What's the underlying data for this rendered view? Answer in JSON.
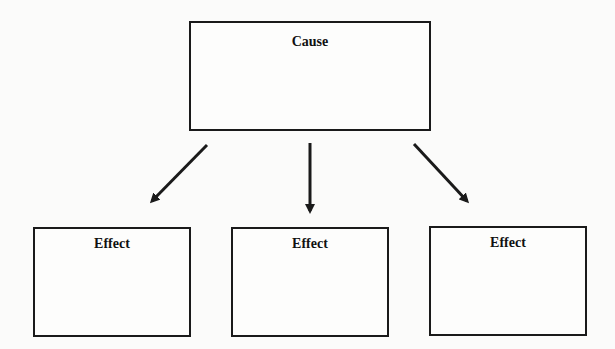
{
  "diagram": {
    "type": "cause-and-effect",
    "cause": {
      "label": "Cause"
    },
    "effects": [
      {
        "label": "Effect"
      },
      {
        "label": "Effect"
      },
      {
        "label": "Effect"
      }
    ],
    "arrows": [
      {
        "from": "cause",
        "to": "effect-1",
        "direction": "down-left"
      },
      {
        "from": "cause",
        "to": "effect-2",
        "direction": "down"
      },
      {
        "from": "cause",
        "to": "effect-3",
        "direction": "down-right"
      }
    ],
    "colors": {
      "stroke": "#1a1a1a",
      "background": "#fbfbfa"
    }
  }
}
